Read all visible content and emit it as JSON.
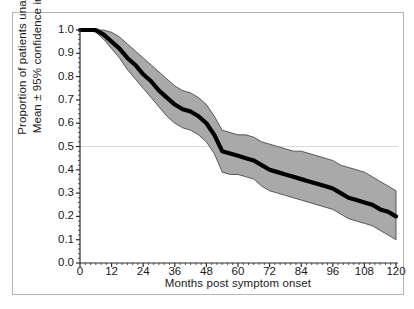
{
  "figure": {
    "type": "survival-curve-figure",
    "background": "#ffffff",
    "frame_color": "#b4b4b4"
  },
  "axes": {
    "x_title": "Months post symptom onset",
    "y_title_line1": "Proportion of patients unaffected",
    "y_title_line2": "Mean ± 95% confidence interval",
    "x_ticks": [
      "0",
      "12",
      "24",
      "36",
      "48",
      "60",
      "72",
      "84",
      "96",
      "108",
      "120"
    ],
    "y_ticks": [
      "1.0",
      "0.9",
      "0.8",
      "0.7",
      "0.6",
      "0.5",
      "0.4",
      "0.3",
      "0.2",
      "0.1",
      "0.0"
    ],
    "reference_line_value": "0.5"
  },
  "colors": {
    "mean_line": "#000000",
    "ci_band": "#a9a9a9",
    "ci_edge": "#3a3a3a",
    "axis": "#2b2b2b",
    "gridline": "#d9d9d9"
  },
  "chart_data": {
    "type": "line",
    "title": "",
    "xlabel": "Months post symptom onset",
    "ylabel": "Proportion of patients unaffected, Mean ± 95% confidence interval",
    "xlim": [
      0,
      120
    ],
    "ylim": [
      0.0,
      1.0
    ],
    "xticks": [
      0,
      12,
      24,
      36,
      48,
      60,
      72,
      84,
      96,
      108,
      120
    ],
    "yticks": [
      0.0,
      0.1,
      0.2,
      0.3,
      0.4,
      0.5,
      0.6,
      0.7,
      0.8,
      0.9,
      1.0
    ],
    "grid": false,
    "legend": "none",
    "annotations": [
      {
        "type": "hline",
        "y": 0.5,
        "label": "median reference line",
        "color": "#d9d9d9"
      }
    ],
    "x": [
      0,
      3,
      6,
      9,
      12,
      15,
      18,
      21,
      24,
      27,
      30,
      33,
      36,
      39,
      42,
      45,
      48,
      51,
      54,
      57,
      60,
      63,
      66,
      69,
      72,
      75,
      78,
      81,
      84,
      87,
      90,
      93,
      96,
      99,
      102,
      105,
      108,
      111,
      114,
      117,
      120
    ],
    "series": [
      {
        "name": "Mean proportion unaffected",
        "style": "thick-black-line",
        "values": [
          1.0,
          1.0,
          1.0,
          0.98,
          0.95,
          0.92,
          0.88,
          0.85,
          0.81,
          0.78,
          0.74,
          0.71,
          0.68,
          0.66,
          0.65,
          0.63,
          0.6,
          0.55,
          0.48,
          0.47,
          0.46,
          0.45,
          0.44,
          0.42,
          0.4,
          0.39,
          0.38,
          0.37,
          0.36,
          0.35,
          0.34,
          0.33,
          0.32,
          0.3,
          0.28,
          0.27,
          0.26,
          0.25,
          0.23,
          0.22,
          0.2
        ]
      },
      {
        "name": "Upper 95% confidence limit",
        "style": "grey-band-upper",
        "values": [
          1.0,
          1.0,
          1.0,
          1.0,
          0.99,
          0.97,
          0.94,
          0.91,
          0.88,
          0.85,
          0.82,
          0.79,
          0.76,
          0.74,
          0.73,
          0.71,
          0.68,
          0.63,
          0.57,
          0.56,
          0.55,
          0.55,
          0.54,
          0.52,
          0.51,
          0.5,
          0.49,
          0.48,
          0.48,
          0.47,
          0.46,
          0.45,
          0.44,
          0.42,
          0.41,
          0.4,
          0.39,
          0.37,
          0.35,
          0.33,
          0.31
        ]
      },
      {
        "name": "Lower 95% confidence limit",
        "style": "grey-band-lower",
        "values": [
          1.0,
          1.0,
          0.99,
          0.96,
          0.92,
          0.88,
          0.83,
          0.79,
          0.75,
          0.71,
          0.67,
          0.63,
          0.6,
          0.58,
          0.57,
          0.55,
          0.52,
          0.47,
          0.39,
          0.38,
          0.38,
          0.37,
          0.36,
          0.33,
          0.31,
          0.3,
          0.29,
          0.28,
          0.27,
          0.26,
          0.25,
          0.24,
          0.23,
          0.21,
          0.19,
          0.18,
          0.17,
          0.16,
          0.14,
          0.12,
          0.1
        ]
      }
    ]
  }
}
